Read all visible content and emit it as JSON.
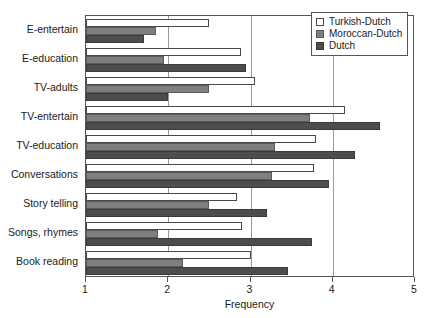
{
  "chart_data": {
    "type": "bar",
    "orientation": "horizontal",
    "title": "",
    "xlabel": "Frequency",
    "ylabel": "",
    "xlim": [
      1,
      5
    ],
    "xticks": [
      1,
      2,
      3,
      4,
      5
    ],
    "xtick_labels": [
      "1",
      "2",
      "3",
      "4",
      "5"
    ],
    "grid": "vertical gridlines at 2, 3, 4",
    "gridlines": [
      2,
      3,
      4
    ],
    "legend_position": "top-right",
    "categories": [
      "E-entertain",
      "E-education",
      "TV-adults",
      "TV-entertain",
      "TV-education",
      "Conversations",
      "Story telling",
      "Songs, rhymes",
      "Book reading"
    ],
    "series": [
      {
        "name": "Turkish-Dutch",
        "color": "#ffffff",
        "values": [
          2.5,
          2.88,
          3.05,
          4.15,
          3.8,
          3.77,
          2.83,
          2.9,
          3.0
        ]
      },
      {
        "name": "Moroccan-Dutch",
        "color": "#7f7f7f",
        "values": [
          1.85,
          1.95,
          2.5,
          3.72,
          3.3,
          3.26,
          2.5,
          1.88,
          2.18
        ]
      },
      {
        "name": "Dutch",
        "color": "#4d4d4d",
        "values": [
          1.7,
          2.95,
          2.0,
          4.58,
          4.27,
          3.95,
          3.2,
          3.75,
          3.45
        ]
      }
    ]
  },
  "legend": {
    "items": [
      {
        "label": "Turkish-Dutch",
        "swatch": "s0"
      },
      {
        "label": "Moroccan-Dutch",
        "swatch": "s1"
      },
      {
        "label": "Dutch",
        "swatch": "s2"
      }
    ]
  },
  "axis": {
    "x_title": "Frequency"
  }
}
